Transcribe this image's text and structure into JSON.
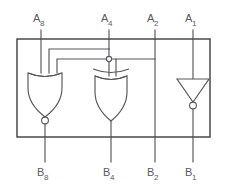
{
  "figure": {
    "kind": "logic-circuit-schematic",
    "colors": {
      "wire": "#56565a",
      "outline": "#4a4a4e",
      "background": "#ffffff",
      "gate_fill": "#ffffff"
    }
  },
  "inputs": [
    {
      "id": "A8",
      "base": "A",
      "subscript": "8",
      "x": 41
    },
    {
      "id": "A4",
      "base": "A",
      "subscript": "4",
      "x": 109
    },
    {
      "id": "A2",
      "base": "A",
      "subscript": "2",
      "x": 155
    },
    {
      "id": "A1",
      "base": "A",
      "subscript": "1",
      "x": 193
    }
  ],
  "outputs": [
    {
      "id": "B8",
      "base": "B",
      "subscript": "8",
      "x": 45
    },
    {
      "id": "B4",
      "base": "B",
      "subscript": "4",
      "x": 111
    },
    {
      "id": "B2",
      "base": "B",
      "subscript": "2",
      "x": 155
    },
    {
      "id": "B1",
      "base": "B",
      "subscript": "1",
      "x": 193
    }
  ],
  "gates": [
    {
      "id": "nor-gate",
      "type": "NOR",
      "label": "NOR",
      "inverted_output": true,
      "cx": 45,
      "cy": 90
    },
    {
      "id": "xor-gate",
      "type": "XOR",
      "label": "XOR",
      "inverted_output": false,
      "cx": 111,
      "cy": 92
    },
    {
      "id": "not-gate",
      "type": "NOT",
      "label": "NOT",
      "inverted_output": true,
      "cx": 193,
      "cy": 90
    }
  ],
  "chip": {
    "x": 17,
    "y": 39,
    "width": 193,
    "height": 98
  },
  "nets": [
    {
      "id": "a2-passthrough",
      "from": "A2",
      "to": "B2"
    },
    {
      "id": "a1-to-not",
      "from": "A1",
      "to": "not-gate"
    },
    {
      "id": "not-to-b1",
      "from": "not-gate",
      "to": "B1"
    },
    {
      "id": "nor-to-b8",
      "from": "nor-gate",
      "to": "B8"
    },
    {
      "id": "xor-to-b4",
      "from": "xor-gate",
      "to": "B4"
    },
    {
      "id": "a4-to-nor",
      "from": "A4",
      "to": "nor-gate"
    },
    {
      "id": "a2-to-nor",
      "from": "A2",
      "to": "nor-gate"
    },
    {
      "id": "a8-to-nor",
      "from": "A8",
      "to": "nor-gate"
    },
    {
      "id": "a4-to-xor",
      "from": "A4",
      "to": "xor-gate"
    },
    {
      "id": "a2-to-xor",
      "from": "A2",
      "to": "xor-gate"
    }
  ]
}
